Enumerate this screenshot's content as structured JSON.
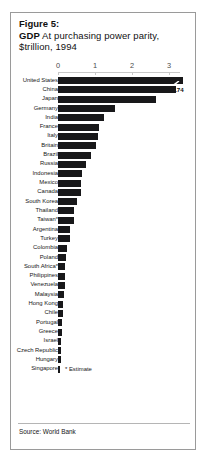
{
  "figure": {
    "label": "Figure 5:",
    "title_strong": "GDP",
    "title_rest": "At purchasing power parity,",
    "subtitle": "$trillion, 1994",
    "estimate_note": "* Estimate",
    "source": "Source: World Bank",
    "value_tag": "6.74",
    "colors": {
      "bar": "#18181a",
      "border": "#9a9a9a",
      "axis": "#c8c8c8",
      "text": "#161616"
    }
  },
  "chart_data": {
    "type": "bar",
    "orientation": "horizontal",
    "title": "GDP At purchasing power parity, $trillion, 1994",
    "xlabel": "",
    "ylabel": "",
    "xlim": [
      0,
      3.4
    ],
    "axis_break": true,
    "axis_break_note": "United States bar is truncated with a break marker; true value 6.74",
    "ticks": [
      0,
      1,
      2,
      3
    ],
    "tick_labels": [
      "0",
      "1",
      "2",
      "3"
    ],
    "grid": false,
    "legend": "none",
    "units": "$ trillion",
    "year": 1994,
    "source": "World Bank",
    "categories": [
      "United States",
      "China",
      "Japan",
      "Germany",
      "India",
      "France",
      "Italy",
      "Britain",
      "Brazil",
      "Russia",
      "Indonesia",
      "Mexico",
      "Canada",
      "South Korea",
      "Thailand",
      "Taiwan*",
      "Argentina",
      "Turkey",
      "Colombia",
      "Poland",
      "South Africa*",
      "Philippines",
      "Venezuela",
      "Malaysia",
      "Hong Kong",
      "Chile",
      "Portugal",
      "Greece",
      "Israel",
      "Czech Republic",
      "Hungary",
      "Singapore"
    ],
    "values": [
      6.74,
      3.2,
      2.65,
      1.55,
      1.25,
      1.1,
      1.07,
      1.02,
      0.89,
      0.77,
      0.66,
      0.63,
      0.61,
      0.51,
      0.44,
      0.43,
      0.33,
      0.32,
      0.23,
      0.22,
      0.2,
      0.19,
      0.18,
      0.17,
      0.14,
      0.13,
      0.12,
      0.11,
      0.08,
      0.08,
      0.07,
      0.06
    ],
    "displayed_bar_values": [
      3.37,
      3.2,
      2.65,
      1.55,
      1.25,
      1.1,
      1.07,
      1.02,
      0.89,
      0.77,
      0.66,
      0.63,
      0.61,
      0.51,
      0.44,
      0.43,
      0.33,
      0.32,
      0.23,
      0.22,
      0.2,
      0.19,
      0.18,
      0.17,
      0.14,
      0.13,
      0.12,
      0.11,
      0.08,
      0.08,
      0.07,
      0.06
    ]
  }
}
